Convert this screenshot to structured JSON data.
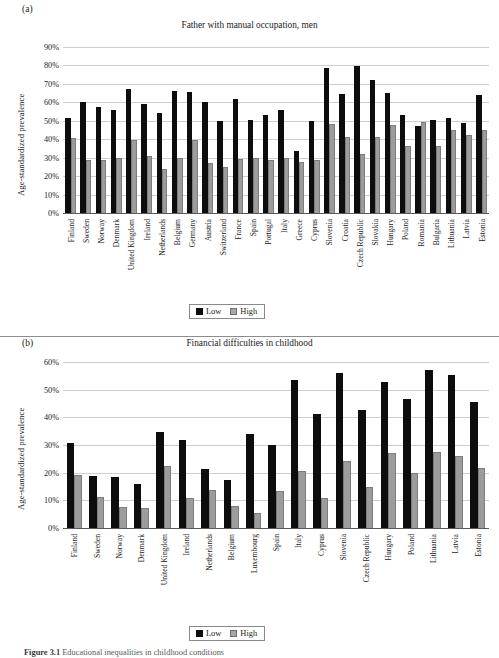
{
  "figure": {
    "caption_label": "Figure 3.1",
    "caption_text": "Educational inequalities in childhood conditions"
  },
  "legend": {
    "low_label": "Low",
    "high_label": "High",
    "low_color": "#0d0d0d",
    "high_color": "#a8a8a8"
  },
  "panels": [
    {
      "letter": "(a)",
      "title": "Father with manual occupation, men",
      "ylabel": "Age-standardized prevalence",
      "yticks": [
        "0%",
        "10%",
        "20%",
        "30%",
        "40%",
        "50%",
        "60%",
        "70%",
        "80%",
        "90%"
      ]
    },
    {
      "letter": "(b)",
      "title": "Financial difficulties in childhood",
      "ylabel": "Age-standardized prevalence",
      "yticks": [
        "0%",
        "10%",
        "20%",
        "30%",
        "40%",
        "50%",
        "60%"
      ]
    }
  ],
  "chart_data": [
    {
      "type": "bar",
      "title": "Father with manual occupation, men",
      "panel": "(a)",
      "xlabel": "",
      "ylabel": "Age-standardized prevalence",
      "ylim": [
        0,
        90
      ],
      "ytick_interval": 10,
      "ytick_format": "percent",
      "grid": true,
      "legend_position": "bottom-center",
      "categories": [
        "Finland",
        "Sweden",
        "Norway",
        "Denmark",
        "United Kingdom",
        "Ireland",
        "Netherlands",
        "Belgium",
        "Germany",
        "Austria",
        "Switzerland",
        "France",
        "Spain",
        "Portugal",
        "Italy",
        "Greece",
        "Cyprus",
        "Slovenia",
        "Croatia",
        "Czech Republic",
        "Slovakia",
        "Hungary",
        "Poland",
        "Romania",
        "Bulgaria",
        "Lithuania",
        "Latvia",
        "Estonia"
      ],
      "series": [
        {
          "name": "Low",
          "color": "#0d0d0d",
          "values": [
            51.7,
            60.2,
            57.4,
            56.1,
            67.4,
            59.1,
            54.0,
            66.4,
            65.5,
            60.1,
            50.1,
            61.8,
            50.2,
            53.3,
            55.8,
            33.5,
            50.1,
            78.4,
            64.7,
            79.5,
            72.0,
            65.3,
            53.2,
            47.2,
            50.3,
            51.5,
            48.8,
            64.0
          ]
        },
        {
          "name": "High",
          "color": "#a8a8a8",
          "values": [
            40.8,
            28.9,
            29.0,
            29.9,
            39.4,
            30.9,
            23.7,
            30.0,
            39.8,
            27.2,
            25.1,
            29.4,
            30.0,
            28.8,
            29.7,
            27.5,
            28.8,
            48.0,
            41.4,
            32.1,
            41.3,
            47.5,
            36.4,
            49.6,
            36.4,
            45.1,
            42.3,
            45.0
          ]
        }
      ]
    },
    {
      "type": "bar",
      "title": "Financial difficulties in childhood",
      "panel": "(b)",
      "xlabel": "",
      "ylabel": "Age-standardized prevalence",
      "ylim": [
        0,
        60
      ],
      "ytick_interval": 10,
      "ytick_format": "percent",
      "grid": true,
      "legend_position": "bottom-center",
      "categories": [
        "Finland",
        "Sweden",
        "Norway",
        "Denmark",
        "United Kingdom",
        "Ireland",
        "Netherlands",
        "Belgium",
        "Luxembourg",
        "Spain",
        "Italy",
        "Cyprus",
        "Slovenia",
        "Czech Republic",
        "Hungary",
        "Poland",
        "Lithuania",
        "Latvia",
        "Estonia"
      ],
      "series": [
        {
          "name": "Low",
          "color": "#0d0d0d",
          "values": [
            30.8,
            18.7,
            18.4,
            16.0,
            34.6,
            31.9,
            21.5,
            17.2,
            34.0,
            30.0,
            53.5,
            41.2,
            56.0,
            42.7,
            52.8,
            46.7,
            57.0,
            55.4,
            45.5
          ]
        },
        {
          "name": "High",
          "color": "#a8a8a8",
          "values": [
            19.3,
            11.2,
            7.6,
            7.4,
            22.5,
            10.8,
            13.6,
            8.1,
            5.5,
            13.5,
            20.6,
            10.8,
            24.2,
            14.8,
            27.2,
            19.9,
            27.3,
            26.1,
            21.6
          ]
        }
      ]
    }
  ]
}
